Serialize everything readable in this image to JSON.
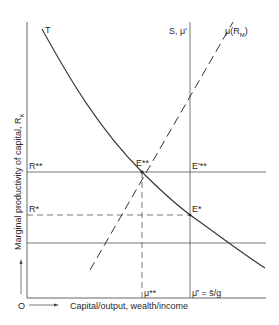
{
  "diagram": {
    "y_axis_label": "Marginal productivity of capital, R",
    "y_axis_label_sub": "K",
    "x_axis_label": "Capital/output, wealth/income",
    "origin_label": "O",
    "curves": {
      "T": "T",
      "mu_label": "μ(R",
      "mu_sub": "M",
      "mu_close": ")",
      "S_label": "S, μ'"
    },
    "y_ticks": {
      "R_double_star": "R**",
      "R_star": "R*"
    },
    "x_ticks": {
      "mu_double_star": "μ**",
      "mu_bar": "μ̄' = s̄/g"
    },
    "points": {
      "E_double_star": "E**",
      "E_prime_double_star": "E'**",
      "E_star": "E*"
    },
    "colors": {
      "line": "#3a3a3a",
      "thin_line": "#6a6a6a",
      "background": "#ffffff"
    }
  }
}
